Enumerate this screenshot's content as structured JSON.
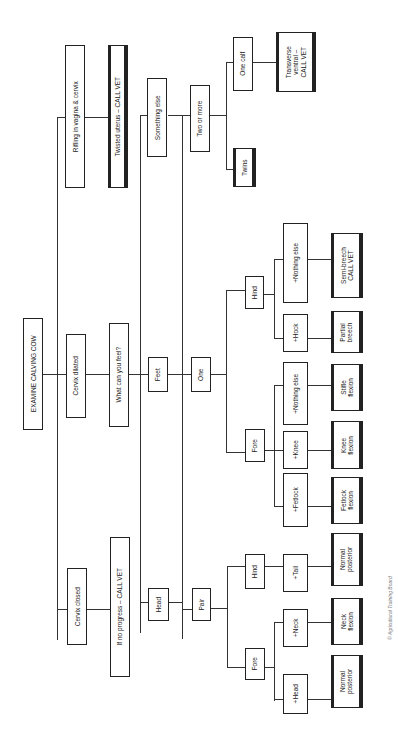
{
  "diagram": {
    "title": "EXAMINE CALVING COW",
    "orientation": "rotated 90° counter-clockwise",
    "nodes": {
      "root": "EXAMINE CALVING COW",
      "cervix_closed": "Cervix closed",
      "no_progress": "If no progress – CALL VET",
      "cervix_dilated": "Cervix dilated",
      "what_feel": "What can you feel?",
      "rifling": "Rifling in vagina & cervix",
      "twisted": "Twisted uterus – CALL VET",
      "head": "Head",
      "feet": "Feet",
      "something_else": "Something else",
      "pair": "Pair",
      "one": "One",
      "two_more": "Two or more",
      "pair_fore": "Fore",
      "pair_hind": "Hind",
      "one_fore": "Fore",
      "one_hind": "Hind",
      "plus_head": "+Head",
      "plus_neck": "+Neck",
      "plus_tail": "+Tail",
      "plus_fetlock": "+Fetlock",
      "plus_knee": "+Knee",
      "fore_nothing": "+Nothing else",
      "plus_hock": "+Hock",
      "hind_nothing": "+Nothing else",
      "twins": "Twins",
      "one_calf": "One calf",
      "normal_anterior": "Normal\nposterior",
      "neck_flexion": "Neck\nflexion",
      "normal_posterior": "Normal\nposterior",
      "fetlock_flexion": "Fetlock\nflexion",
      "knee_flexion": "Knee\nflexion",
      "stifle_flexion": "Stifle\nflexion",
      "partial_breech": "Partial\nbreech",
      "semi_breech": "Semi-breech\nCALL VET",
      "transverse": "Transverse\nventral –\nCALL VET"
    },
    "credit": "© Agricultural Training Board"
  }
}
